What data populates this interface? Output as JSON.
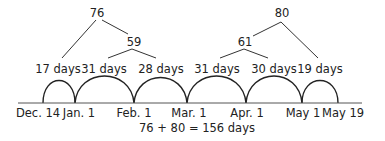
{
  "tree": {
    "left_total": "76",
    "left_sub": "59",
    "right_total": "80",
    "right_sub": "61"
  },
  "segments": [
    {
      "label": "17 days"
    },
    {
      "label": "31 days"
    },
    {
      "label": "28 days"
    },
    {
      "label": "31 days"
    },
    {
      "label": "30 days"
    },
    {
      "label": "19 days"
    }
  ],
  "dates": [
    {
      "label": "Dec. 14"
    },
    {
      "label": "Jan. 1"
    },
    {
      "label": "Feb. 1"
    },
    {
      "label": "Mar. 1"
    },
    {
      "label": "Apr. 1"
    },
    {
      "label": "May 1"
    },
    {
      "label": "May 19"
    }
  ],
  "equation": "76 + 80 = 156 days"
}
